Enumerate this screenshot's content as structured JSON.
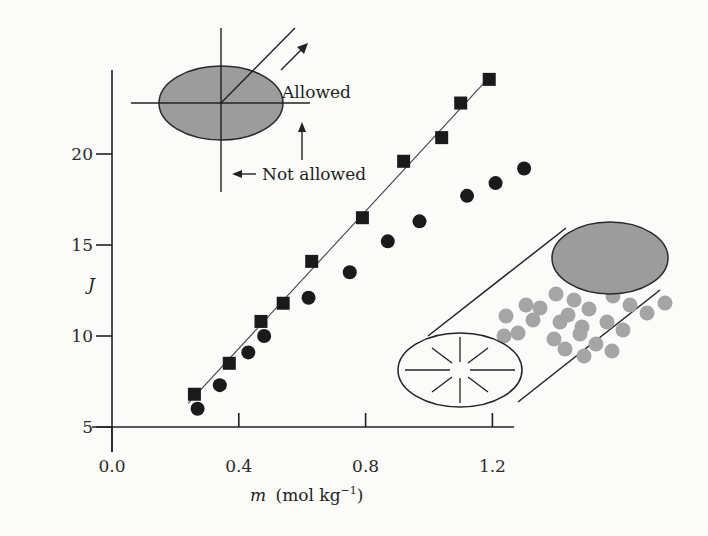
{
  "chart_data": {
    "type": "scatter",
    "title": "",
    "xlabel": "m (mol kg⁻¹)",
    "xlabel_parts": {
      "var": "m",
      "unit": "(mol kg",
      "sup": "−1",
      "close": ")"
    },
    "ylabel": "J",
    "xlim": [
      0.0,
      1.3
    ],
    "ylim": [
      5,
      24.5
    ],
    "grid": false,
    "legend": null,
    "x_ticks": [
      {
        "value": 0.0,
        "label": "0.0"
      },
      {
        "value": 0.4,
        "label": "0.4"
      },
      {
        "value": 0.8,
        "label": "0.8"
      },
      {
        "value": 1.2,
        "label": "1.2"
      }
    ],
    "y_ticks": [
      {
        "value": 5,
        "label": "5"
      },
      {
        "value": 10,
        "label": "10"
      },
      {
        "value": 15,
        "label": "15"
      },
      {
        "value": 20,
        "label": "20"
      }
    ],
    "series": [
      {
        "name": "squares",
        "marker": "square",
        "color": "#1a1a1a",
        "fit_line": {
          "x": [
            0.24,
            1.2
          ],
          "y": [
            6.3,
            24.4
          ]
        },
        "x": [
          0.26,
          0.37,
          0.47,
          0.54,
          0.63,
          0.79,
          0.92,
          1.04,
          1.1,
          1.19
        ],
        "y": [
          6.8,
          8.5,
          10.8,
          11.8,
          14.1,
          16.5,
          19.6,
          20.9,
          22.8,
          24.1
        ]
      },
      {
        "name": "circles",
        "marker": "circle",
        "color": "#1a1a1a",
        "x": [
          0.27,
          0.34,
          0.43,
          0.48,
          0.62,
          0.75,
          0.87,
          0.97,
          1.12,
          1.21,
          1.3
        ],
        "y": [
          6.0,
          7.3,
          9.1,
          10.0,
          12.1,
          13.5,
          15.2,
          16.3,
          17.7,
          18.4,
          19.2
        ]
      }
    ],
    "annotations": [
      {
        "text": "Allowed",
        "type": "label-with-arrow"
      },
      {
        "text": "Not allowed",
        "type": "label-with-arrow"
      }
    ],
    "insets": [
      {
        "name": "oblate-ellipse-orientation",
        "description": "shaded ellipse with axes and diagonal arrow"
      },
      {
        "name": "rod-micelle",
        "description": "cylinder packed with gray spheres, shaded end cap, radial lines on open end"
      }
    ]
  },
  "colors": {
    "ink": "#1a1a1a",
    "shade": "#9a9a9a",
    "sphere": "#a5a5a5",
    "background": "#fbfbf9"
  }
}
